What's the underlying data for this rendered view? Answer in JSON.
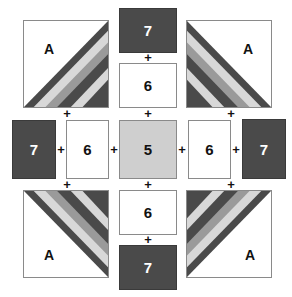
{
  "diagram": {
    "title": "",
    "colors": {
      "dark": "#4a4a4a",
      "light": "#d8d8d8",
      "mid": "#9a9a9a",
      "center": "#cfcfcf",
      "white": "#ffffff"
    },
    "corners": [
      {
        "id": "top-left",
        "label": "A"
      },
      {
        "id": "top-right",
        "label": "A"
      },
      {
        "id": "bottom-left",
        "label": "A"
      },
      {
        "id": "bottom-right",
        "label": "A"
      }
    ],
    "top": {
      "outer": "7",
      "inner": "6"
    },
    "bottom": {
      "outer": "7",
      "inner": "6"
    },
    "left": {
      "outer": "7",
      "inner": "6"
    },
    "right": {
      "outer": "7",
      "inner": "6"
    },
    "center": "5",
    "join_symbol": "+"
  }
}
